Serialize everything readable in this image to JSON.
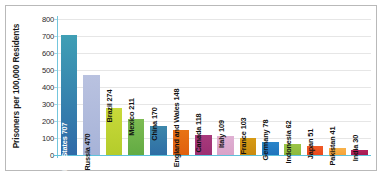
{
  "chart_data": {
    "type": "bar",
    "title": "",
    "subtitle": "",
    "xlabel": "",
    "ylabel": "Prisoners per 100,000 Residents",
    "ylim": [
      0,
      800
    ],
    "ytick_labels": [
      "800",
      "700",
      "600",
      "500",
      "400",
      "300",
      "200",
      "100",
      "0"
    ],
    "ytick_values": [
      800,
      700,
      600,
      500,
      400,
      300,
      200,
      100,
      0
    ],
    "grid": true,
    "grid_axis": "y",
    "legend": false,
    "legend_position": "none",
    "categories": [
      "United States",
      "Russia",
      "Brazil",
      "Mexico",
      "China",
      "England and Wales",
      "Canada",
      "Italy",
      "France",
      "Germany",
      "Indonesia",
      "Japan",
      "Pakistan",
      "India"
    ],
    "values": [
      707,
      470,
      274,
      211,
      170,
      148,
      118,
      109,
      103,
      78,
      62,
      51,
      41,
      30
    ],
    "data_labels": [
      "United States 707",
      "Russia 470",
      "Brazil 274",
      "Mexico 211",
      "China 170",
      "England and Wales 148",
      "Canada 118",
      "Italy 109",
      "France 103",
      "Germany 78",
      "Indonesia 62",
      "Japan 51",
      "Pakistan 41",
      "India 30"
    ],
    "label_placement": [
      "inside",
      "inside",
      "outside",
      "outside",
      "outside",
      "outside",
      "outside",
      "outside",
      "outside",
      "outside",
      "outside",
      "outside",
      "outside",
      "outside"
    ],
    "label_colors": [
      "#ffffff",
      "#111111",
      "#111111",
      "#111111",
      "#111111",
      "#111111",
      "#111111",
      "#111111",
      "#111111",
      "#111111",
      "#111111",
      "#111111",
      "#111111",
      "#111111"
    ],
    "bar_colors": [
      "#2f6aa8",
      "#a7b3d8",
      "#b4cc2b",
      "#62ab43",
      "#2e6ea5",
      "#e0600f",
      "#9c2f72",
      "#d9a3c8",
      "#c88a10",
      "#1f74bd",
      "#8cb93c",
      "#ea4a1e",
      "#f5a33a",
      "#a51a52"
    ],
    "bar_top_colors": [
      "#3f9fb5",
      "#b9c2e0",
      "#c8d93a",
      "#7dbb52",
      "#3d87ab",
      "#e87314",
      "#a8397c",
      "#e0b0d3",
      "#d79a14",
      "#2a85c9",
      "#9bc547",
      "#f05a26",
      "#f8b24a",
      "#b3245c"
    ],
    "axis_color": "#5ec2dc",
    "gridline_color": "#e6e6e6",
    "border_color": "#b9b9b9",
    "background_color": "#ffffff"
  }
}
